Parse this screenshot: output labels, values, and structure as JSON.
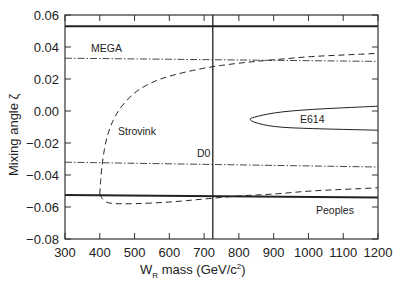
{
  "chart_data": {
    "type": "line",
    "title": "",
    "xlabel": "W_R mass (GeV/c^2)",
    "ylabel": "Mixing angle ζ",
    "xlim": [
      300,
      1200
    ],
    "ylim": [
      -0.08,
      0.06
    ],
    "xticks": [
      300,
      400,
      500,
      600,
      700,
      800,
      900,
      1000,
      1100,
      1200
    ],
    "yticks": [
      -0.08,
      -0.06,
      -0.04,
      -0.02,
      0.0,
      0.02,
      0.04,
      0.06
    ],
    "xtick_labels": [
      "300",
      "400",
      "500",
      "600",
      "700",
      "800",
      "900",
      "1000",
      "1100",
      "1200"
    ],
    "ytick_labels": [
      "−0.08",
      "−0.06",
      "−0.04",
      "−0.02",
      "0.00",
      "0.02",
      "0.04",
      "0.06"
    ],
    "grid": false,
    "series": [
      {
        "name": "Top bound (solid)",
        "style": "solid-heavy",
        "x": [
          300,
          1200
        ],
        "y": [
          0.053,
          0.053
        ]
      },
      {
        "name": "MEGA",
        "style": "dash-dot",
        "x": [
          300,
          1200
        ],
        "y": [
          0.033,
          0.031
        ]
      },
      {
        "name": "MEGA lower",
        "style": "dash-dot",
        "x": [
          300,
          1200
        ],
        "y": [
          -0.032,
          -0.035
        ]
      },
      {
        "name": "Peoples",
        "style": "solid-heavy",
        "x": [
          300,
          1200
        ],
        "y": [
          -0.0525,
          -0.054
        ]
      },
      {
        "name": "D0",
        "style": "solid-vertical",
        "x": [
          725,
          725
        ],
        "y": [
          -0.08,
          0.06
        ]
      },
      {
        "name": "Strovink (upper branch)",
        "style": "dashed",
        "x": [
          400,
          405,
          420,
          450,
          500,
          550,
          600,
          700,
          800,
          900,
          1000,
          1100,
          1200
        ],
        "y": [
          -0.052,
          -0.035,
          -0.015,
          0.0,
          0.012,
          0.018,
          0.022,
          0.027,
          0.03,
          0.032,
          0.034,
          0.035,
          0.036
        ]
      },
      {
        "name": "Strovink (lower branch)",
        "style": "dashed",
        "x": [
          400,
          410,
          430,
          500,
          600,
          700,
          800,
          900,
          1000,
          1100,
          1200
        ],
        "y": [
          -0.052,
          -0.056,
          -0.058,
          -0.058,
          -0.057,
          -0.055,
          -0.053,
          -0.052,
          -0.05,
          -0.049,
          -0.048
        ]
      },
      {
        "name": "E614",
        "style": "solid-contour",
        "x": [
          1200,
          1000,
          900,
          840,
          830,
          840,
          900,
          1000,
          1200
        ],
        "y": [
          0.003,
          0.001,
          -0.001,
          -0.004,
          -0.005,
          -0.007,
          -0.01,
          -0.011,
          -0.012
        ]
      }
    ],
    "annotations": [
      {
        "text": "MEGA",
        "x": 340,
        "y": 0.036
      },
      {
        "text": "Strovink",
        "x": 460,
        "y": -0.018
      },
      {
        "text": "D0",
        "x": 690,
        "y": -0.028
      },
      {
        "text": "E614",
        "x": 1000,
        "y": -0.005
      },
      {
        "text": "Peoples",
        "x": 1110,
        "y": -0.063
      }
    ]
  },
  "labels": {
    "ylabel": "Mixing angle ζ",
    "xlabel_main": "W",
    "xlabel_sub": "R",
    "xlabel_rest": " mass  (GeV/c",
    "xlabel_sup": "2",
    "xlabel_end": ")",
    "mega": "MEGA",
    "strovink": "Strovink",
    "d0": "D0",
    "e614": "E614",
    "peoples": "Peoples"
  }
}
